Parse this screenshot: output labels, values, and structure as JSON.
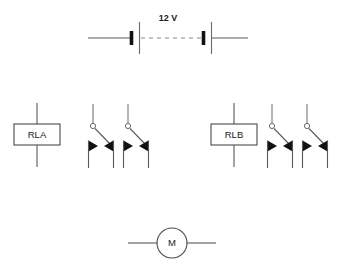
{
  "diagram": {
    "background_color": "#ffffff",
    "line_color": "#595959",
    "ink_color": "#111111"
  },
  "battery": {
    "label": "12 V",
    "symbol": "battery-two-cell",
    "left_lead_x1": 88,
    "left_lead_x2": 130,
    "right_lead_x1": 212,
    "right_lead_x2": 248,
    "baseline_y": 38,
    "cells": [
      {
        "thick_plate_x": 131,
        "thin_plate_x": 139
      },
      {
        "thick_plate_x": 203,
        "thin_plate_x": 211
      }
    ],
    "dash_x1": 141,
    "dash_x2": 201,
    "label_x": 168,
    "label_y": 19
  },
  "relays": [
    {
      "name": "RLA",
      "coil_label": "RLA",
      "coil_box": {
        "x": 14,
        "y": 124,
        "width": 46,
        "height": 21
      },
      "coil_lead_top_y": 103,
      "coil_lead_bottom_y": 167,
      "coil_center_x": 37,
      "contacts": [
        {
          "name": "rla-contact-1",
          "type": "changeover",
          "pivot_x": 93,
          "pivot_y": 126,
          "stem_top_y": 104,
          "blade_end_x": 111,
          "blade_end_y": 144,
          "left_terminal_x": 88,
          "right_terminal_x": 113,
          "terminal_top_y": 144,
          "terminal_bottom_y": 168
        },
        {
          "name": "rla-contact-2",
          "type": "changeover",
          "pivot_x": 128,
          "pivot_y": 126,
          "stem_top_y": 104,
          "blade_end_x": 146,
          "blade_end_y": 144,
          "left_terminal_x": 123,
          "right_terminal_x": 148,
          "terminal_top_y": 144,
          "terminal_bottom_y": 168
        }
      ]
    },
    {
      "name": "RLB",
      "coil_label": "RLB",
      "coil_box": {
        "x": 211,
        "y": 124,
        "width": 46,
        "height": 21
      },
      "coil_lead_top_y": 103,
      "coil_lead_bottom_y": 167,
      "coil_center_x": 234,
      "contacts": [
        {
          "name": "rlb-contact-1",
          "type": "changeover",
          "pivot_x": 272,
          "pivot_y": 126,
          "stem_top_y": 104,
          "blade_end_x": 290,
          "blade_end_y": 144,
          "left_terminal_x": 267,
          "right_terminal_x": 292,
          "terminal_top_y": 144,
          "terminal_bottom_y": 168
        },
        {
          "name": "rlb-contact-2",
          "type": "changeover",
          "pivot_x": 307,
          "pivot_y": 126,
          "stem_top_y": 104,
          "blade_end_x": 325,
          "blade_end_y": 144,
          "left_terminal_x": 302,
          "right_terminal_x": 327,
          "terminal_top_y": 144,
          "terminal_bottom_y": 168
        }
      ]
    }
  ],
  "motor": {
    "label": "M",
    "symbol": "motor-circle",
    "center_x": 172,
    "center_y": 243,
    "radius": 15,
    "left_lead_x1": 128,
    "left_lead_x2": 157,
    "right_lead_x1": 187,
    "right_lead_x2": 216,
    "lead_y": 243
  }
}
